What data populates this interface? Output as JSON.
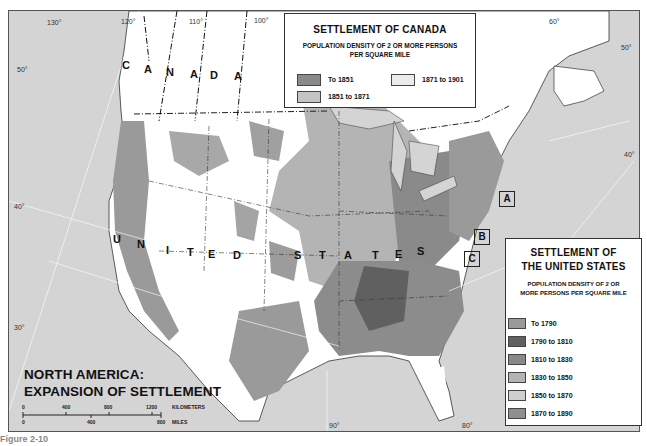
{
  "map": {
    "title_line1": "NORTH AMERICA:",
    "title_line2": "EXPANSION OF SETTLEMENT",
    "country_labels": {
      "canada": [
        "C",
        "A",
        "N",
        "A",
        "D",
        "A"
      ],
      "united_states": [
        "U",
        "N",
        "I",
        "T",
        "E",
        "D",
        "S",
        "T",
        "A",
        "T",
        "E",
        "S"
      ]
    },
    "inset_boxes": [
      "A",
      "B",
      "C"
    ],
    "graticule": {
      "longitudes": [
        "130°",
        "120°",
        "110°",
        "100°",
        "90°",
        "80°",
        "60°"
      ],
      "latitudes": [
        "50°",
        "40°",
        "30°"
      ],
      "right_latitudes": [
        "50°",
        "40°"
      ]
    },
    "scale": {
      "km_ticks": [
        "0",
        "400",
        "800",
        "1200"
      ],
      "km_label": "KILOMETERS",
      "mile_ticks": [
        "0",
        "400",
        "800"
      ],
      "mile_label": "MILES"
    },
    "caption": "Figure 2-10"
  },
  "canada_legend": {
    "title": "SETTLEMENT OF CANADA",
    "subtitle_line1": "POPULATION DENSITY OF 2 OR MORE PERSONS",
    "subtitle_line2": "PER SQUARE MILE",
    "items": [
      {
        "label": "To 1851",
        "color": "#8a8a8a"
      },
      {
        "label": "1851 to 1871",
        "color": "#c4c4c4"
      },
      {
        "label": "1871 to 1901",
        "color": "#ececec"
      }
    ]
  },
  "us_legend": {
    "title_line1": "SETTLEMENT OF",
    "title_line2": "THE UNITED STATES",
    "subtitle_line1": "POPULATION DENSITY OF 2 OR",
    "subtitle_line2": "MORE PERSONS PER SQUARE MILE",
    "items": [
      {
        "label": "To 1790",
        "color": "#9a9a9a"
      },
      {
        "label": "1790 to 1810",
        "color": "#606060"
      },
      {
        "label": "1810 to 1830",
        "color": "#888888"
      },
      {
        "label": "1830 to 1850",
        "color": "#b4b4b4"
      },
      {
        "label": "1850 to 1870",
        "color": "#cfcfcf"
      },
      {
        "label": "1870 to 1890",
        "color": "#8f8f8f"
      }
    ]
  },
  "colors": {
    "water": "#d4d4d4",
    "unsettled_land": "#ffffff",
    "border": "#222222"
  }
}
